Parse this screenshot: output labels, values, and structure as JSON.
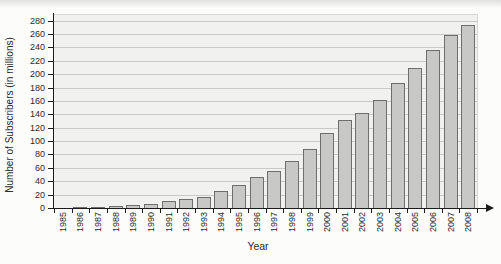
{
  "chart_data": {
    "type": "bar",
    "title": "",
    "xlabel": "Year",
    "ylabel": "Number of Subscribers (in millions)",
    "categories": [
      "1985",
      "1986",
      "1987",
      "1988",
      "1989",
      "1990",
      "1991",
      "1992",
      "1993",
      "1994",
      "1995",
      "1996",
      "1997",
      "1998",
      "1999",
      "2000",
      "2001",
      "2002",
      "2003",
      "2004",
      "2005",
      "2006",
      "2007",
      "2008"
    ],
    "values": [
      0.5,
      1,
      2,
      3,
      4.5,
      6.5,
      10,
      13,
      17,
      26,
      35,
      46,
      56,
      71,
      88,
      112,
      131,
      142,
      161,
      187,
      210,
      236,
      258,
      273
    ],
    "ylim": [
      0,
      290
    ],
    "yticks": [
      0,
      20,
      40,
      60,
      80,
      100,
      120,
      140,
      160,
      180,
      200,
      220,
      240,
      260,
      280
    ],
    "grid": true,
    "legend_position": "none",
    "colors": {
      "bar_fill": "#c8c8c6",
      "bar_border": "#6e6e6e",
      "plot_bg": "#f1f1ef",
      "gridline": "#c9c9c9",
      "axis": "#1c1c1c",
      "text": "#2b2b2b"
    }
  }
}
